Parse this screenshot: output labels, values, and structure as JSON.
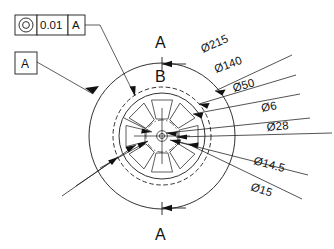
{
  "drawing": {
    "title": "Rotor front view with concentricity callout",
    "background_color": "#ffffff",
    "line_color": "#1a1a1a"
  },
  "feature_control_frame": {
    "name": "concentricity-frame",
    "symbol_name": "concentricity-symbol",
    "tolerance": "0.01",
    "datum_reference": "A"
  },
  "datum_feature": {
    "name": "datum-feature-a",
    "label": "A"
  },
  "section_labels": {
    "top": "A",
    "top_inner": "B",
    "bottom": "A"
  },
  "dimensions": [
    {
      "id": "d215",
      "label": "Ø215",
      "value": 215,
      "symbol": "Ø",
      "angle_deg": -24
    },
    {
      "id": "d140",
      "label": "Ø140",
      "value": 140,
      "symbol": "Ø",
      "angle_deg": -20
    },
    {
      "id": "d50",
      "label": "Ø50",
      "value": 50,
      "symbol": "Ø",
      "angle_deg": -16
    },
    {
      "id": "d6",
      "label": "Ø6",
      "value": 6,
      "symbol": "Ø",
      "angle_deg": -11
    },
    {
      "id": "d28",
      "label": "Ø28",
      "value": 28,
      "symbol": "Ø",
      "angle_deg": -5
    },
    {
      "id": "d14_5",
      "label": "Ø14.5",
      "value": 14.5,
      "symbol": "Ø",
      "angle_deg": 15
    },
    {
      "id": "d15",
      "label": "Ø15",
      "value": 15,
      "symbol": "Ø",
      "angle_deg": 18
    }
  ],
  "geometry": {
    "center_x": 162,
    "center_y": 136,
    "outer_circle_r": 73,
    "dashed_circle_r": 49,
    "inner_circle_r": 43,
    "hub_circle_r": 16,
    "bore_r": 5,
    "spoke_count": 8
  }
}
